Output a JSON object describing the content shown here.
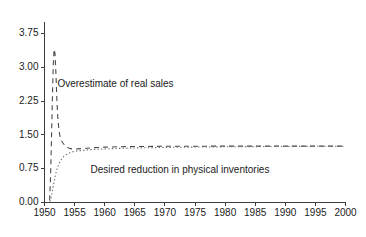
{
  "chart_data": {
    "type": "line",
    "title": "",
    "xlabel": "",
    "ylabel": "",
    "xlim": [
      1950,
      2000
    ],
    "ylim": [
      0.0,
      3.75
    ],
    "grid": false,
    "legend_position": "none",
    "xticks": [
      1950,
      1955,
      1960,
      1965,
      1970,
      1975,
      1980,
      1985,
      1990,
      1995,
      2000
    ],
    "xtick_labels": [
      "1950",
      "1955",
      "1960",
      "1965",
      "1970",
      "1975",
      "1980",
      "1985",
      "1990",
      "1995",
      "2000"
    ],
    "yticks": [
      0.0,
      0.75,
      1.5,
      2.25,
      3.0,
      3.75
    ],
    "ytick_labels": [
      "0.00",
      "0.75",
      "1.50",
      "2.25",
      "3.00",
      "3.75"
    ],
    "annotations": [
      {
        "text": "Overestimate of real sales",
        "x": 1961.8,
        "y": 2.62,
        "anchor": "middle"
      },
      {
        "text": "Desired reduction in physical inventories",
        "x": 1972.5,
        "y": 0.72,
        "anchor": "middle"
      }
    ],
    "series": [
      {
        "name": "Overestimate of real sales",
        "style": "dashed",
        "color": "#4a4a4a",
        "x": [
          1950.85,
          1951.0,
          1951.15,
          1951.3,
          1951.45,
          1951.6,
          1951.75,
          1951.9,
          1952.05,
          1952.2,
          1952.4,
          1952.6,
          1952.8,
          1953.0,
          1953.3,
          1953.6,
          1954.0,
          1954.5,
          1955.0,
          1955.5,
          1956.0,
          1957.0,
          1958.0,
          1959.0,
          1960.0,
          1961.0,
          1962.0,
          1964.0,
          1966.0,
          1968.0,
          1970.0,
          1974.0,
          1978.0,
          1982.0,
          1986.0,
          1990.0,
          1994.0,
          1997.0,
          2000.0
        ],
        "y": [
          0.05,
          0.55,
          1.35,
          2.25,
          3.05,
          3.4,
          3.3,
          2.85,
          2.3,
          1.9,
          1.6,
          1.45,
          1.38,
          1.33,
          1.28,
          1.24,
          1.21,
          1.19,
          1.185,
          1.19,
          1.195,
          1.205,
          1.215,
          1.222,
          1.228,
          1.232,
          1.236,
          1.24,
          1.243,
          1.245,
          1.247,
          1.249,
          1.25,
          1.25,
          1.251,
          1.251,
          1.251,
          1.251,
          1.251
        ]
      },
      {
        "name": "Desired reduction in physical inventories",
        "style": "dotted",
        "color": "#6e6e6e",
        "x": [
          1950.9,
          1951.1,
          1951.3,
          1951.5,
          1951.8,
          1952.1,
          1952.4,
          1952.8,
          1953.2,
          1953.6,
          1954.0,
          1954.5,
          1955.0,
          1955.5,
          1956.0,
          1957.0,
          1958.0,
          1959.0,
          1960.0,
          1961.0,
          1962.0,
          1964.0,
          1966.0,
          1968.0,
          1970.0,
          1974.0,
          1978.0,
          1982.0,
          1986.0,
          1990.0,
          1994.0,
          1997.0,
          2000.0
        ],
        "y": [
          0.02,
          0.1,
          0.24,
          0.4,
          0.6,
          0.75,
          0.86,
          0.96,
          1.02,
          1.06,
          1.09,
          1.12,
          1.135,
          1.145,
          1.152,
          1.165,
          1.175,
          1.182,
          1.188,
          1.194,
          1.199,
          1.207,
          1.213,
          1.218,
          1.222,
          1.229,
          1.234,
          1.238,
          1.241,
          1.244,
          1.246,
          1.248,
          1.249
        ]
      }
    ]
  }
}
